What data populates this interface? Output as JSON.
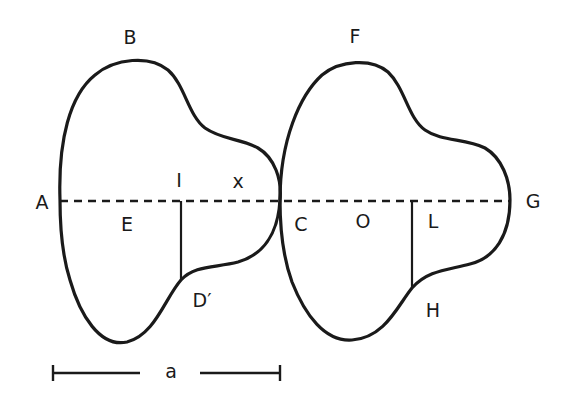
{
  "figure": {
    "labels": {
      "A": "A",
      "B": "B",
      "C": "C",
      "D": "D′",
      "E": "E",
      "F": "F",
      "G": "G",
      "H": "H",
      "I": "I",
      "L": "L",
      "O": "O",
      "x": "x"
    },
    "scale_bar": {
      "label": "a"
    },
    "colors": {
      "stroke": "#1a1a1a",
      "background": "#ffffff"
    }
  }
}
